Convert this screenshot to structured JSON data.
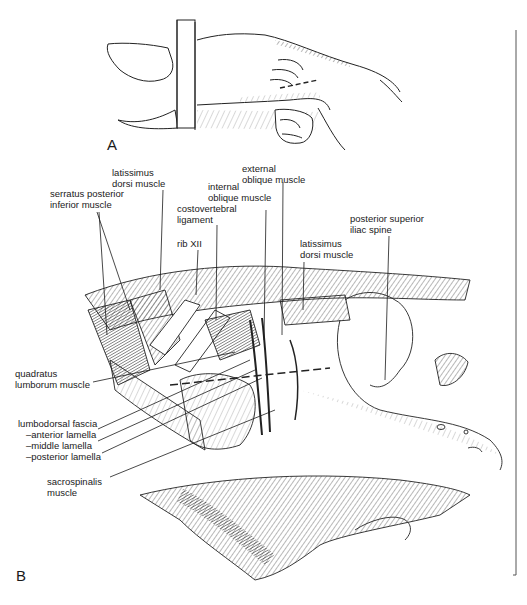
{
  "figure": {
    "panels": [
      {
        "id": "A",
        "label": "A"
      },
      {
        "id": "B",
        "label": "B"
      }
    ],
    "labels": {
      "serratus": "serratus posterior\ninferior muscle",
      "latissimus_top": "latissimus\ndorsi muscle",
      "costovertebral": "costovertebral\nligament",
      "internal_oblique": "internal\noblique muscle",
      "external_oblique": "external\noblique muscle",
      "rib": "rib XII",
      "latissimus_right": "latissimus\ndorsi muscle",
      "psis": "posterior superior\niliac spine",
      "quadratus": "quadratus\nlumborum muscle",
      "lumbodorsal": "lumbodorsal fascia",
      "anterior_lamella": "–anterior lamella",
      "middle_lamella": "–middle lamella",
      "posterior_lamella": "–posterior lamella",
      "sacrospinalis": "sacrospinalis\nmuscle"
    }
  }
}
